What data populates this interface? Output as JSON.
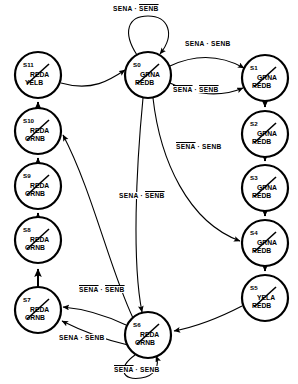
{
  "diagram": {
    "type": "state-machine",
    "node_radius": 23,
    "signals": [
      "SENA",
      "SENB"
    ],
    "outputs": [
      "GRNA",
      "REDA",
      "YELA",
      "GRNB",
      "REDB",
      "YELB"
    ]
  },
  "nodes": [
    {
      "id": "S0",
      "cx": 148,
      "cy": 75,
      "out_a": "GRNA",
      "out_b": "REDB"
    },
    {
      "id": "S1",
      "cx": 265,
      "cy": 78,
      "out_a": "GRNA",
      "out_b": "REDB"
    },
    {
      "id": "S2",
      "cx": 265,
      "cy": 134,
      "out_a": "GRNA",
      "out_b": "REDB"
    },
    {
      "id": "S3",
      "cx": 265,
      "cy": 188,
      "out_a": "GRNA",
      "out_b": "REDB"
    },
    {
      "id": "S4",
      "cx": 265,
      "cy": 243,
      "out_a": "GRNA",
      "out_b": "REDB"
    },
    {
      "id": "S5",
      "cx": 265,
      "cy": 298,
      "out_a": "YELA",
      "out_b": "REDB"
    },
    {
      "id": "S6",
      "cx": 148,
      "cy": 335,
      "out_a": "REDA",
      "out_b": "GRNB"
    },
    {
      "id": "S7",
      "cx": 38,
      "cy": 310,
      "out_a": "REDA",
      "out_b": "GRNB"
    },
    {
      "id": "S8",
      "cx": 38,
      "cy": 240,
      "out_a": "REDA",
      "out_b": "GRNB"
    },
    {
      "id": "S9",
      "cx": 38,
      "cy": 186,
      "out_a": "REDA",
      "out_b": "GRNB"
    },
    {
      "id": "S10",
      "cx": 38,
      "cy": 131,
      "out_a": "REDA",
      "out_b": "GRNB"
    },
    {
      "id": "S11",
      "cx": 38,
      "cy": 75,
      "out_a": "REDA",
      "out_b": "YELB"
    }
  ],
  "transitions": [
    {
      "name": "s0-self",
      "from": "S0",
      "to": "S0",
      "a": "SENA",
      "a_bar": false,
      "b": "SENB",
      "b_bar": true,
      "x": 112,
      "y": 5
    },
    {
      "name": "s0-s1-a",
      "from": "S0",
      "to": "S1",
      "a": "SENA",
      "a_bar": false,
      "b": "SENB",
      "b_bar": false,
      "x": 184,
      "y": 40
    },
    {
      "name": "s0-s1-b",
      "from": "S0",
      "to": "S1",
      "a": "SENA",
      "a_bar": true,
      "b": "SENB",
      "b_bar": true,
      "x": 172,
      "y": 86
    },
    {
      "name": "s0-s4",
      "from": "S0",
      "to": "S4",
      "a": "SENA",
      "a_bar": true,
      "b": "SENB",
      "b_bar": false,
      "x": 175,
      "y": 143
    },
    {
      "name": "s0-s6",
      "from": "S0",
      "to": "S6",
      "a": "SENA",
      "a_bar": false,
      "b": "SENB",
      "b_bar": true,
      "x": 118,
      "y": 192
    },
    {
      "name": "s6-s7-a",
      "from": "S6",
      "to": "S7",
      "a": "SENA",
      "a_bar": true,
      "b": "SENB",
      "b_bar": true,
      "x": 78,
      "y": 286
    },
    {
      "name": "s6-s7-b",
      "from": "S6",
      "to": "S7",
      "a": "SENA",
      "a_bar": false,
      "b": "SENB",
      "b_bar": false,
      "x": 58,
      "y": 334
    },
    {
      "name": "s6-self",
      "from": "S6",
      "to": "S6",
      "a": "SENA",
      "a_bar": true,
      "b": "SENB",
      "b_bar": false,
      "x": 113,
      "y": 366
    }
  ],
  "plain_edges": [
    {
      "name": "s1-s2",
      "from": "S1",
      "to": "S2"
    },
    {
      "name": "s2-s3",
      "from": "S2",
      "to": "S3"
    },
    {
      "name": "s3-s4",
      "from": "S3",
      "to": "S4"
    },
    {
      "name": "s4-s5",
      "from": "S4",
      "to": "S5"
    },
    {
      "name": "s5-s6",
      "from": "S5",
      "to": "S6"
    },
    {
      "name": "s6-s10",
      "from": "S6",
      "to": "S10"
    },
    {
      "name": "s7-s8",
      "from": "S7",
      "to": "S8"
    },
    {
      "name": "s8-s9",
      "from": "S8",
      "to": "S9"
    },
    {
      "name": "s9-s10",
      "from": "S9",
      "to": "S10"
    },
    {
      "name": "s10-s11",
      "from": "S10",
      "to": "S11"
    },
    {
      "name": "s11-s0",
      "from": "S11",
      "to": "S0"
    }
  ],
  "separator": "·"
}
